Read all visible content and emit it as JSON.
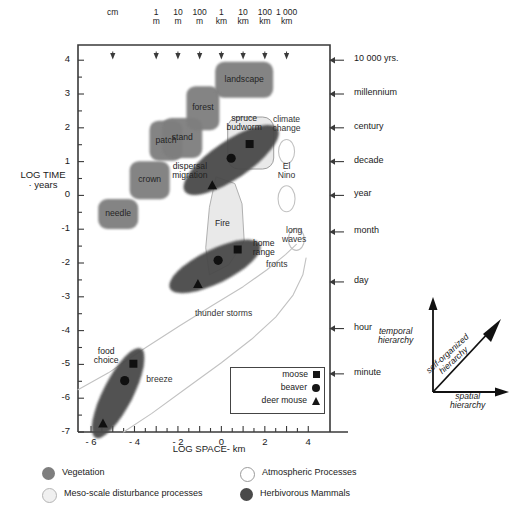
{
  "figure": {
    "axes": {
      "y_title_line1": "LOG TIME",
      "y_title_line2": "· years",
      "x_title": "LOG SPACE- km",
      "x_ticks": [
        "- 6",
        "- 4",
        "- 2",
        "0",
        "2",
        "4"
      ],
      "x_tick_values": [
        -6,
        -4,
        -2,
        0,
        2,
        4
      ],
      "y_ticks": [
        "4",
        "3",
        "2",
        "1",
        "0",
        "-1",
        "-2",
        "-3",
        "-4",
        "-5",
        "-6",
        "-7"
      ],
      "y_tick_values": [
        4,
        3,
        2,
        1,
        0,
        -1,
        -2,
        -3,
        -4,
        -5,
        -6,
        -7
      ],
      "xlim": [
        -6.6,
        5.0
      ],
      "ylim": [
        -7.0,
        4.45
      ]
    },
    "top_scale": {
      "items": [
        {
          "line1": "",
          "line2": "cm",
          "x": -5.0
        },
        {
          "line1": "1",
          "line2": "m",
          "x": -3.0
        },
        {
          "line1": "10",
          "line2": "m",
          "x": -2.0
        },
        {
          "line1": "100",
          "line2": "m",
          "x": -1.0
        },
        {
          "line1": "1",
          "line2": "km",
          "x": 0.0
        },
        {
          "line1": "10",
          "line2": "km",
          "x": 1.0
        },
        {
          "line1": "100",
          "line2": "km",
          "x": 2.0
        },
        {
          "line1": "1 000",
          "line2": "km",
          "x": 3.0
        }
      ]
    },
    "right_time_labels": [
      {
        "label": "10 000 yrs.",
        "y": 4.0
      },
      {
        "label": "millennium",
        "y": 3.0
      },
      {
        "label": "century",
        "y": 2.0
      },
      {
        "label": "decade",
        "y": 1.0
      },
      {
        "label": "year",
        "y": 0.0
      },
      {
        "label": "month",
        "y": -1.08
      },
      {
        "label": "day",
        "y": -2.56
      },
      {
        "label": "hour",
        "y": -3.94
      },
      {
        "label": "minute",
        "y": -5.28
      }
    ],
    "vegetation": [
      {
        "label": "needle",
        "x": -4.75,
        "y": -0.55,
        "w": 40,
        "h": 30
      },
      {
        "label": "crown",
        "x": -3.3,
        "y": 0.45,
        "w": 40,
        "h": 38
      },
      {
        "label": "patch",
        "x": -2.55,
        "y": 1.62,
        "w": 33,
        "h": 40
      },
      {
        "label": "stand",
        "x": -1.8,
        "y": 1.7,
        "w": 40,
        "h": 40
      },
      {
        "label": "forest",
        "x": -0.85,
        "y": 2.58,
        "w": 33,
        "h": 44
      },
      {
        "label": "landscape",
        "x": 1.05,
        "y": 3.42,
        "w": 58,
        "h": 36
      }
    ],
    "meso_scale": [
      {
        "label": "spruce\nbudworm",
        "label_line1": "spruce",
        "label_line2": "budworm",
        "x": 1.35,
        "y": 1.55,
        "w": 46,
        "h": 52,
        "label_x": 1.05,
        "label_y": 2.15
      },
      {
        "label": "Fire",
        "x": 0.2,
        "y": -0.9,
        "label_x": 0.05,
        "label_y": -0.85
      }
    ],
    "atmospheric": [
      {
        "label_line1": "climate",
        "label_line2": "change",
        "label_x": 3.0,
        "label_y": 2.12,
        "x": 3.0,
        "y": 1.3,
        "w": 16,
        "h": 24
      },
      {
        "label_line1": "El",
        "label_line2": "Nino",
        "label_x": 3.0,
        "label_y": 0.72,
        "x": 3.0,
        "y": -0.1,
        "w": 17,
        "h": 26
      },
      {
        "label_line1": "long",
        "label_line2": "waves",
        "label_x": 3.35,
        "label_y": -1.18,
        "x": 3.45,
        "y": -1.3,
        "w": 16,
        "h": 22
      },
      {
        "label": "fronts",
        "label_x": 2.55,
        "label_y": -2.05
      },
      {
        "label": "thunder storms",
        "label_x": 0.1,
        "label_y": -3.5
      },
      {
        "label": "breeze",
        "label_x": -2.85,
        "label_y": -5.45
      }
    ],
    "mammals": [
      {
        "label_line1": "dispersal",
        "label_line2": "migration",
        "label_x": -1.45,
        "label_y": 0.72,
        "cx": 0.45,
        "cy": 1.05,
        "rx": 56,
        "ry": 19,
        "rot": -34,
        "markers": [
          {
            "name": "moose",
            "shape": "square",
            "x": 1.3,
            "y": 1.52
          },
          {
            "name": "beaver",
            "shape": "circle",
            "x": 0.45,
            "y": 1.1
          },
          {
            "name": "deer mouse",
            "shape": "triangle",
            "x": -0.42,
            "y": 0.3
          }
        ]
      },
      {
        "label_line1": "home",
        "label_line2": "range",
        "label_x": 1.95,
        "label_y": -1.55,
        "cx": -0.3,
        "cy": -2.1,
        "rx": 50,
        "ry": 17,
        "rot": -26,
        "markers": [
          {
            "name": "moose",
            "shape": "square",
            "x": 0.75,
            "y": -1.6
          },
          {
            "name": "beaver",
            "shape": "circle",
            "x": -0.15,
            "y": -1.92
          },
          {
            "name": "deer mouse",
            "shape": "triangle",
            "x": -1.08,
            "y": -2.62
          }
        ]
      },
      {
        "label_line1": "food",
        "label_line2": "choice",
        "label_x": -5.3,
        "label_y": -4.75,
        "cx": -4.75,
        "cy": -5.85,
        "rx": 50,
        "ry": 15,
        "rot": -63,
        "markers": [
          {
            "name": "moose",
            "shape": "square",
            "x": -4.05,
            "y": -4.98
          },
          {
            "name": "beaver",
            "shape": "circle",
            "x": -4.45,
            "y": -5.48
          },
          {
            "name": "deer mouse",
            "shape": "triangle",
            "x": -5.45,
            "y": -6.75
          }
        ]
      }
    ],
    "marker_legend": {
      "rows": [
        {
          "label": "moose",
          "symbol": "square"
        },
        {
          "label": "beaver",
          "symbol": "circle"
        },
        {
          "label": "deer mouse",
          "symbol": "triangle"
        }
      ]
    },
    "category_key": [
      {
        "label": "Vegetation",
        "swatch": "vegetation"
      },
      {
        "label": "Atmospheric Processes",
        "swatch": "atmospheric"
      },
      {
        "label": "Meso-scale disturbance processes",
        "swatch": "meso"
      },
      {
        "label": "Herbivorous Mammals",
        "swatch": "mammals"
      }
    ],
    "hierarchy_diagram": {
      "temporal_line1": "temporal",
      "temporal_line2": "hierarchy",
      "spatial_line1": "spatial",
      "spatial_line2": "hierarchy",
      "self_line1": "self-organized",
      "self_line2": "hierarchy"
    },
    "colors": {
      "vegetation": "#7e7e7e",
      "meso": "#e9e9e9",
      "atmospheric": "#ffffff",
      "mammals": "#4a4a4a",
      "axis": "#333333"
    }
  },
  "chart_data": {
    "type": "scatter",
    "xlabel": "LOG SPACE- km",
    "ylabel": "LOG TIME · years",
    "xlim": [
      -6.6,
      5.0
    ],
    "ylim": [
      -7.0,
      4.45
    ],
    "grid": false,
    "legend_position": "bottom",
    "series": [
      {
        "name": "Vegetation",
        "type": "regions",
        "points": [
          {
            "label": "needle",
            "x": -4.75,
            "y": -0.55
          },
          {
            "label": "crown",
            "x": -3.3,
            "y": 0.45
          },
          {
            "label": "patch",
            "x": -2.55,
            "y": 1.62
          },
          {
            "label": "stand",
            "x": -1.8,
            "y": 1.7
          },
          {
            "label": "forest",
            "x": -0.85,
            "y": 2.58
          },
          {
            "label": "landscape",
            "x": 1.05,
            "y": 3.42
          }
        ]
      },
      {
        "name": "Meso-scale disturbance processes",
        "type": "regions",
        "points": [
          {
            "label": "spruce budworm",
            "x": 1.35,
            "y": 1.55
          },
          {
            "label": "Fire",
            "x": 0.2,
            "y": -0.9
          }
        ]
      },
      {
        "name": "Atmospheric Processes",
        "type": "regions",
        "points": [
          {
            "label": "climate change",
            "x": 3.0,
            "y": 1.3
          },
          {
            "label": "El Nino",
            "x": 3.0,
            "y": -0.1
          },
          {
            "label": "long waves",
            "x": 3.45,
            "y": -1.3
          },
          {
            "label": "fronts",
            "x": 2.55,
            "y": -2.05
          },
          {
            "label": "thunder storms",
            "x": 0.1,
            "y": -3.5
          },
          {
            "label": "breeze",
            "x": -2.85,
            "y": -5.45
          }
        ]
      },
      {
        "name": "Herbivorous Mammals",
        "type": "regions",
        "points": [
          {
            "label": "dispersal migration - moose",
            "x": 1.3,
            "y": 1.52
          },
          {
            "label": "dispersal migration - beaver",
            "x": 0.45,
            "y": 1.1
          },
          {
            "label": "dispersal migration - deer mouse",
            "x": -0.42,
            "y": 0.3
          },
          {
            "label": "home range - moose",
            "x": 0.75,
            "y": -1.6
          },
          {
            "label": "home range - beaver",
            "x": -0.15,
            "y": -1.92
          },
          {
            "label": "home range - deer mouse",
            "x": -1.08,
            "y": -2.62
          },
          {
            "label": "food choice - moose",
            "x": -4.05,
            "y": -4.98
          },
          {
            "label": "food choice - beaver",
            "x": -4.45,
            "y": -5.48
          },
          {
            "label": "food choice - deer mouse",
            "x": -5.45,
            "y": -6.75
          }
        ]
      }
    ],
    "secondary_x_axis": {
      "label": "spatial scale",
      "ticks": [
        "cm",
        "1 m",
        "10 m",
        "100 m",
        "1 km",
        "10 km",
        "100 km",
        "1 000 km"
      ],
      "tick_values": [
        -5,
        -3,
        -2,
        -1,
        0,
        1,
        2,
        3
      ]
    },
    "secondary_y_axis": {
      "label": "time scale",
      "ticks": [
        "10 000 yrs.",
        "millennium",
        "century",
        "decade",
        "year",
        "month",
        "day",
        "hour",
        "minute"
      ],
      "tick_values": [
        4.0,
        3.0,
        2.0,
        1.0,
        0.0,
        -1.08,
        -2.56,
        -3.94,
        -5.28
      ]
    }
  }
}
